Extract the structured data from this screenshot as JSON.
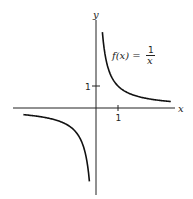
{
  "chart_data": {
    "type": "line",
    "title": "",
    "xlabel": "x",
    "ylabel": "y",
    "annotation": {
      "lhs": "f(x) =",
      "numerator": "1",
      "denominator": "x"
    },
    "x_ticks": [
      {
        "value": 1,
        "label": "1"
      }
    ],
    "y_ticks": [
      {
        "value": 1,
        "label": "1"
      }
    ],
    "xlim": [
      -3.8,
      3.6
    ],
    "ylim": [
      -4.0,
      4.0
    ],
    "grid": false,
    "legend": "none",
    "series": [
      {
        "name": "f(x) = 1/x (x > 0)",
        "function": "1/x",
        "x_range": [
          0.29,
          3.4
        ],
        "color": "#111111"
      },
      {
        "name": "f(x) = 1/x (x < 0)",
        "function": "1/x",
        "x_range": [
          -3.3,
          -0.3
        ],
        "color": "#111111"
      }
    ]
  }
}
